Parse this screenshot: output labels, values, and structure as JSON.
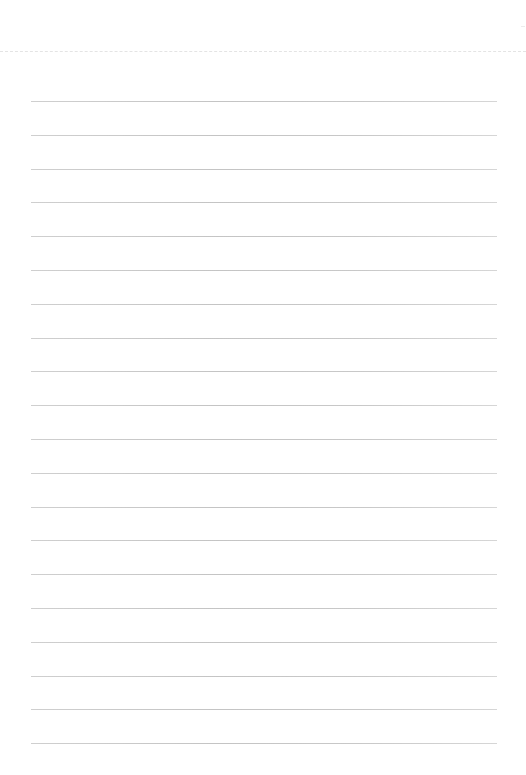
{
  "page": {
    "type": "lined-paper",
    "background_color": "#ffffff",
    "perforation": {
      "style": "dashed",
      "color": "#e4e4e4",
      "y": 51
    },
    "rules": {
      "count": 20,
      "first_y": 101,
      "spacing": 33.8,
      "x_start": 31,
      "x_end": 497,
      "color": "#c8c8c8"
    }
  }
}
